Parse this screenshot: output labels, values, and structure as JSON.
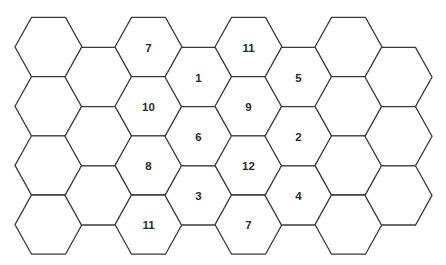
{
  "board": {
    "geometry": {
      "col0_x": 48.5,
      "col_spacing": 50,
      "row0_y_even": 47,
      "row0_y_odd": 77,
      "row_spacing": 59.2,
      "half_width": 33.5,
      "half_top": 17,
      "half_height": 29.6
    },
    "colors": {
      "stroke": "#3a3a3a",
      "fill": "#ffffff",
      "text": "#2a2a2a"
    },
    "columns": [
      {
        "col": 0,
        "cells": [
          "",
          "",
          "",
          ""
        ]
      },
      {
        "col": 1,
        "cells": [
          "",
          "",
          ""
        ]
      },
      {
        "col": 2,
        "cells": [
          "7",
          "10",
          "8",
          "11"
        ]
      },
      {
        "col": 3,
        "cells": [
          "1",
          "6",
          "3"
        ]
      },
      {
        "col": 4,
        "cells": [
          "11",
          "9",
          "12",
          "7"
        ]
      },
      {
        "col": 5,
        "cells": [
          "5",
          "2",
          "4"
        ]
      },
      {
        "col": 6,
        "cells": [
          "",
          "",
          "",
          ""
        ]
      },
      {
        "col": 7,
        "cells": [
          "",
          "",
          ""
        ]
      }
    ]
  }
}
